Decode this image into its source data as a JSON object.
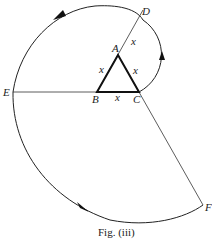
{
  "figure": {
    "caption": "Fig. (iii)",
    "points": {
      "A": {
        "label": "A",
        "x": 118,
        "y": 55
      },
      "B": {
        "label": "B",
        "x": 97,
        "y": 92
      },
      "C": {
        "label": "C",
        "x": 139,
        "y": 92
      },
      "D": {
        "label": "D",
        "x": 143,
        "y": 10
      },
      "E": {
        "label": "E",
        "x": 13,
        "y": 92
      },
      "F": {
        "label": "F",
        "x": 203,
        "y": 205
      }
    },
    "side_labels": [
      "x",
      "x",
      "x",
      "x"
    ],
    "arcs": [
      {
        "from": "C",
        "to": "D",
        "center": "A",
        "radius": "x"
      },
      {
        "from": "D",
        "to": "E",
        "center": "B",
        "radius": "2x"
      },
      {
        "from": "E",
        "to": "F",
        "center": "C",
        "radius": "3x"
      }
    ],
    "colors": {
      "stroke": "#222222",
      "background": "#ffffff"
    }
  }
}
